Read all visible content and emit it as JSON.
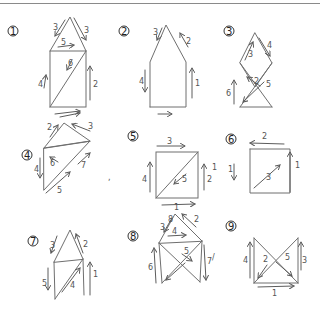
{
  "figures": [
    {
      "id": "1",
      "shape": "house with diagonal",
      "labels": [
        "3",
        "3",
        "5",
        "6",
        "4",
        "2"
      ]
    },
    {
      "id": "2",
      "shape": "house outline (pentagon)",
      "labels": [
        "3",
        "2",
        "4",
        "1",
        "1"
      ]
    },
    {
      "id": "3",
      "shape": "diamond over crossed square",
      "labels": [
        "3",
        "4",
        "2",
        "5",
        "6"
      ]
    },
    {
      "id": "4",
      "shape": "two triangles with diagonal",
      "labels": [
        "2",
        "3",
        "4",
        "6",
        "7",
        "5"
      ]
    },
    {
      "id": "5",
      "shape": "square with diagonal",
      "labels": [
        "3",
        "4",
        "5",
        "2",
        "1"
      ]
    },
    {
      "id": "6",
      "shape": "square open corner with diagonal",
      "labels": [
        "2",
        "1",
        "3",
        "1"
      ]
    },
    {
      "id": "7",
      "shape": "house with diagonal (left)",
      "labels": [
        "3",
        "2",
        "5",
        "4",
        "1"
      ]
    },
    {
      "id": "8",
      "shape": "house with crossed square",
      "labels": [
        "3",
        "2",
        "4",
        "5",
        "6",
        "7",
        "8"
      ]
    },
    {
      "id": "9",
      "shape": "square with X (bowtie)",
      "labels": [
        "4",
        "2",
        "5",
        "3",
        "1"
      ]
    }
  ]
}
